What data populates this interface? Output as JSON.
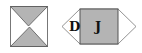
{
  "figure": {
    "left_shape": {
      "name": "hourglass-box",
      "fill": "#b4b4b4",
      "stroke": "#555555"
    },
    "right_shape": {
      "name": "hexagon-with-square",
      "labels": [
        "D",
        "J"
      ],
      "square_fill": "#b4b4b4",
      "stroke": "#555555"
    }
  }
}
